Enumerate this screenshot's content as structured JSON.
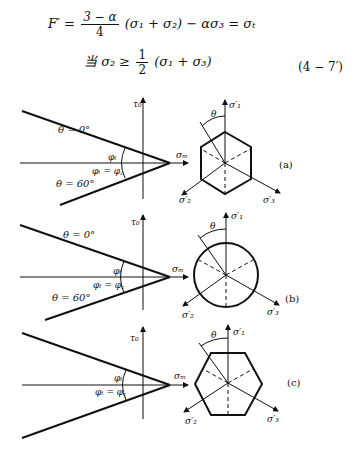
{
  "equations": {
    "line1": "F′ = (3 − α)/4 (σ₁ + σ₂) − ασ₃ = σₜ",
    "line1_parts": {
      "lhs": "F′ =",
      "num": "3 − α",
      "den": "4",
      "rhs": "(σ₁ + σ₂) − ασ₃ = σₜ"
    },
    "line2": "当 σ₂ ≥ ½(σ₁ + σ₃)",
    "line2_parts": {
      "prefix": "当 σ₂ ≥",
      "num": "1",
      "den": "2",
      "rhs": "(σ₁ + σ₃)"
    },
    "eq_number": "(4 − 7′)"
  },
  "figure": {
    "panels": [
      {
        "id": "a",
        "label": "(a)",
        "shape": "hexagon-pointy",
        "theta_top": "θ = 0°",
        "theta_bottom": "θ = 60°"
      },
      {
        "id": "b",
        "label": "(b)",
        "shape": "circle",
        "theta_top": "θ = 0°",
        "theta_bottom": "θ = 60°"
      },
      {
        "id": "c",
        "label": "(c)",
        "shape": "hexagon-flat",
        "theta_top": "",
        "theta_bottom": ""
      }
    ],
    "axis_labels": {
      "tau": "τ₀",
      "sigma_m": "σₘ",
      "phi_t": "φₜ",
      "phi_eq": "φₜ = φ꜀",
      "theta": "θ",
      "s1": "σ′₁",
      "s2": "σ′₂",
      "s3": "σ′₃"
    }
  }
}
